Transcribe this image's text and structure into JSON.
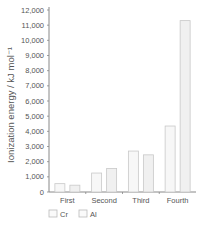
{
  "chart_data": {
    "type": "bar",
    "title": "",
    "xlabel": "",
    "ylabel": "Ionization energy / kJ mol⁻¹",
    "ylim": [
      0,
      12000
    ],
    "yticks": [
      0,
      1000,
      2000,
      3000,
      4000,
      5000,
      6000,
      7000,
      8000,
      9000,
      10000,
      11000,
      12000
    ],
    "ytick_labels": [
      "0",
      "1,000",
      "2,000",
      "3,000",
      "4,000",
      "5,000",
      "6,000",
      "7,000",
      "8,000",
      "9,000",
      "10,000",
      "11,000",
      "12,000"
    ],
    "categories": [
      "First",
      "Second",
      "Third",
      "Fourth"
    ],
    "series": [
      {
        "name": "Cr",
        "values": [
          550,
          1250,
          2700,
          4350
        ],
        "color": "#f7f7f7"
      },
      {
        "name": "Al",
        "values": [
          450,
          1550,
          2450,
          11300
        ],
        "color": "#f0f0f0"
      }
    ],
    "grid": false,
    "legend": {
      "placement": "bottom-left",
      "entries": [
        "Cr",
        "Al"
      ]
    }
  },
  "caption": "Comparison of ionization energies"
}
